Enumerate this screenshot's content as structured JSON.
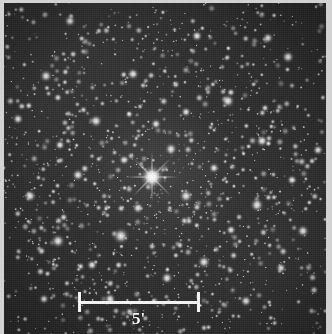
{
  "figure": {
    "kind": "astronomical-plate"
  },
  "colors": {
    "sky_background": "#2b2b2b",
    "star_white": "#f5f5f5",
    "plate_border": "#d2d2d2",
    "annotation_white": "#f2f2f2"
  },
  "image_area": {
    "x": 4,
    "y": 3,
    "width": 322,
    "height": 331
  },
  "scale_bar": {
    "label": "5'",
    "value": 5,
    "unit": "arcmin",
    "x_left": 78,
    "x_right": 200,
    "y_center": 302,
    "tick_half_height": 10,
    "bar_thickness": 3,
    "label_x": 132,
    "label_y": 310
  },
  "central_star": {
    "name": "bright-central-star",
    "x": 152,
    "y": 177,
    "radius": 5.0,
    "spike_length": 26,
    "has_diffraction_spikes": true
  },
  "chart_data": {
    "type": "scatter",
    "title": "",
    "xlabel": "",
    "ylabel": "",
    "legend": [],
    "grid": false,
    "xlim": [
      0,
      322
    ],
    "ylim": [
      0,
      331
    ],
    "note": "Star positions (x,y) in image pixels with brightness radius r; background grain and seeding reproduce plate texture.",
    "series": [
      {
        "name": "bright-stars",
        "points": [
          [
            152,
            177,
            4.8
          ],
          [
            121,
            236,
            3.6
          ],
          [
            58,
            241,
            3.0
          ],
          [
            186,
            196,
            2.9
          ],
          [
            171,
            149,
            2.7
          ],
          [
            228,
            101,
            2.9
          ],
          [
            257,
            205,
            3.0
          ],
          [
            96,
            121,
            2.8
          ],
          [
            46,
            76,
            2.7
          ],
          [
            288,
            57,
            2.7
          ],
          [
            133,
            74,
            2.6
          ],
          [
            204,
            262,
            2.8
          ],
          [
            78,
            175,
            2.6
          ],
          [
            262,
            141,
            2.6
          ],
          [
            30,
            196,
            2.7
          ],
          [
            303,
            231,
            2.7
          ],
          [
            167,
            278,
            2.6
          ],
          [
            110,
            299,
            2.5
          ],
          [
            246,
            301,
            2.5
          ],
          [
            70,
            21,
            2.5
          ],
          [
            197,
            36,
            2.4
          ],
          [
            268,
            38,
            2.4
          ],
          [
            18,
            119,
            2.4
          ],
          [
            318,
            150,
            2.3
          ],
          [
            138,
            208,
            2.5
          ],
          [
            156,
            124,
            2.3
          ],
          [
            214,
            168,
            2.3
          ],
          [
            92,
            265,
            2.3
          ],
          [
            44,
            299,
            2.2
          ],
          [
            281,
            268,
            2.3
          ],
          [
            231,
            230,
            2.2
          ],
          [
            124,
            160,
            2.2
          ],
          [
            186,
            112,
            2.2
          ],
          [
            60,
            145,
            2.2
          ],
          [
            292,
            180,
            2.2
          ]
        ]
      },
      {
        "name": "field-stars",
        "count": 1450,
        "radius_range": [
          0.5,
          2.0
        ],
        "distribution": "random with central concentration"
      }
    ]
  }
}
